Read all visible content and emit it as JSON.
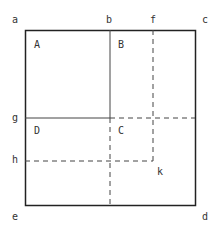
{
  "diagram": {
    "corner_labels": {
      "a": "a",
      "b": "b",
      "f": "f",
      "c": "c",
      "g": "g",
      "h": "h",
      "k": "k",
      "e": "e",
      "d": "d"
    },
    "region_labels": {
      "A": "A",
      "B": "B",
      "C": "C",
      "D": "D"
    },
    "colors": {
      "line": "#333333",
      "background": "#ffffff"
    }
  }
}
